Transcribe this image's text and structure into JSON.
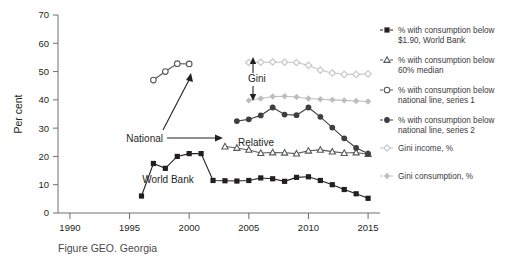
{
  "caption": "Figure GEO. Georgia",
  "axis": {
    "ylabel": "Per cent",
    "yticks": [
      "0",
      "10",
      "20",
      "30",
      "40",
      "50",
      "60",
      "70"
    ],
    "xticks": [
      "1990",
      "1995",
      "2000",
      "2005",
      "2010",
      "2015"
    ]
  },
  "annotations": [
    {
      "name": "national",
      "text": "National"
    },
    {
      "name": "gini",
      "text": "Gini"
    },
    {
      "name": "relative",
      "text": "Relative"
    },
    {
      "name": "world-bank",
      "text": "World Bank"
    }
  ],
  "legend": [
    {
      "marker": "filled-square-icon",
      "line1": "% with consumption below",
      "line2": "$1.90, World Bank",
      "color": "#231f20"
    },
    {
      "marker": "open-triangle-icon",
      "line1": "% with consumption below",
      "line2": "60% median",
      "color": "#58595b"
    },
    {
      "marker": "open-circle-icon",
      "line1": "% with consumption below",
      "line2": "national line, series 1",
      "color": "#58595b"
    },
    {
      "marker": "filled-circle-icon",
      "line1": "% with consumption below",
      "line2": "national line, series 2",
      "color": "#3f3f41"
    },
    {
      "marker": "open-diamond-icon",
      "line1": "Gini income, %",
      "line2": "",
      "color": "#c7c8ca"
    },
    {
      "marker": "filled-diamond-icon",
      "line1": "Gini consumption, %",
      "line2": "",
      "color": "#bcbdbf"
    }
  ],
  "chart_data": {
    "type": "line",
    "title": "Figure GEO. Georgia",
    "xlabel": "",
    "ylabel": "Per cent",
    "xlim": [
      1989,
      2016
    ],
    "ylim": [
      0,
      70
    ],
    "grid": false,
    "legend_position": "right",
    "series": [
      {
        "name": "% with consumption below $1.90, World Bank",
        "marker": "filled-square",
        "color": "#231f20",
        "x": [
          1996,
          1997,
          1998,
          1999,
          2000,
          2001,
          2002,
          2003,
          2004,
          2005,
          2006,
          2007,
          2008,
          2009,
          2010,
          2011,
          2012,
          2013,
          2014,
          2015
        ],
        "values": [
          6.0,
          17.5,
          15.8,
          20.0,
          21.0,
          21.0,
          11.5,
          11.4,
          11.3,
          11.5,
          12.4,
          12.1,
          11.2,
          12.6,
          12.8,
          11.5,
          10.0,
          8.3,
          6.8,
          5.2
        ]
      },
      {
        "name": "% with consumption below 60% median",
        "marker": "open-triangle",
        "color": "#58595b",
        "x": [
          2003,
          2004,
          2005,
          2006,
          2007,
          2008,
          2009,
          2010,
          2011,
          2012,
          2013,
          2014,
          2015
        ],
        "values": [
          23.5,
          23.0,
          22.3,
          21.2,
          21.4,
          21.3,
          21.0,
          22.0,
          22.3,
          21.7,
          21.2,
          21.4,
          20.8
        ]
      },
      {
        "name": "% with consumption below national line, series 1",
        "marker": "open-circle",
        "color": "#58595b",
        "x": [
          1997,
          1998,
          1999,
          2000
        ],
        "values": [
          47.0,
          50.0,
          52.8,
          52.7
        ]
      },
      {
        "name": "% with consumption below national line, series 2",
        "marker": "filled-circle",
        "color": "#3f3f41",
        "x": [
          2004,
          2005,
          2006,
          2007,
          2008,
          2009,
          2010,
          2011,
          2012,
          2013,
          2014,
          2015
        ],
        "values": [
          32.5,
          33.1,
          34.5,
          37.3,
          34.8,
          34.6,
          37.3,
          34.0,
          30.2,
          26.4,
          23.0,
          21.0
        ]
      },
      {
        "name": "Gini income, %",
        "marker": "open-diamond",
        "color": "#c7c8ca",
        "x": [
          2005,
          2006,
          2007,
          2008,
          2009,
          2010,
          2011,
          2012,
          2013,
          2014,
          2015
        ],
        "values": [
          53.2,
          53.3,
          53.4,
          53.3,
          53.2,
          52.2,
          50.5,
          49.5,
          49.0,
          49.0,
          49.2
        ]
      },
      {
        "name": "Gini consumption, %",
        "marker": "filled-diamond",
        "color": "#bcbdbf",
        "x": [
          2005,
          2006,
          2007,
          2008,
          2009,
          2010,
          2011,
          2012,
          2013,
          2014,
          2015
        ],
        "values": [
          39.8,
          40.5,
          41.2,
          41.3,
          41.0,
          40.5,
          40.2,
          40.0,
          39.8,
          39.6,
          39.4
        ]
      }
    ]
  }
}
